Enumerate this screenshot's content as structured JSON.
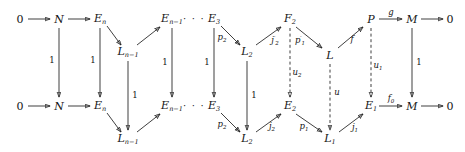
{
  "diagram": {
    "nodes": [
      {
        "id": "n_zero_tl",
        "text": "0",
        "x": 20,
        "y": 19,
        "italic": false
      },
      {
        "id": "n_N_t",
        "text": "N",
        "x": 59,
        "y": 19,
        "italic": true
      },
      {
        "id": "n_En_t",
        "text": "E",
        "sub": "n",
        "x": 100,
        "y": 19,
        "italic": true
      },
      {
        "id": "n_Lnm1_t",
        "text": "L",
        "sub": "n−1",
        "x": 128,
        "y": 52,
        "italic": true
      },
      {
        "id": "n_Enm1_t",
        "text": "E",
        "sub": "n−1",
        "x": 172,
        "y": 19,
        "italic": true
      },
      {
        "id": "n_E3_t",
        "text": "E",
        "sub": "3",
        "x": 214,
        "y": 19,
        "italic": true
      },
      {
        "id": "n_L2_t",
        "text": "L",
        "sub": "2",
        "x": 247,
        "y": 52,
        "italic": true
      },
      {
        "id": "n_F2_t",
        "text": "F",
        "sub": "2",
        "x": 290,
        "y": 19,
        "italic": true
      },
      {
        "id": "n_L_t",
        "text": "L",
        "x": 330,
        "y": 55,
        "italic": true
      },
      {
        "id": "n_P_t",
        "text": "P",
        "x": 371,
        "y": 19,
        "italic": true
      },
      {
        "id": "n_M_t",
        "text": "M",
        "x": 412,
        "y": 19,
        "italic": true
      },
      {
        "id": "n_zero_tr",
        "text": "0",
        "x": 450,
        "y": 19,
        "italic": false
      },
      {
        "id": "n_zero_bl",
        "text": "0",
        "x": 20,
        "y": 106,
        "italic": false
      },
      {
        "id": "n_N_b",
        "text": "N",
        "x": 59,
        "y": 106,
        "italic": true
      },
      {
        "id": "n_En_b",
        "text": "E",
        "sub": "n",
        "x": 100,
        "y": 106,
        "italic": true
      },
      {
        "id": "n_Lnm1_b",
        "text": "L",
        "sub": "n−1",
        "x": 128,
        "y": 139,
        "italic": true
      },
      {
        "id": "n_Enm1_b",
        "text": "E",
        "sub": "n−1",
        "x": 172,
        "y": 106,
        "italic": true
      },
      {
        "id": "n_E3_b",
        "text": "E",
        "sub": "3",
        "x": 214,
        "y": 106,
        "italic": true
      },
      {
        "id": "n_L2_b",
        "text": "L",
        "sub": "2",
        "x": 247,
        "y": 139,
        "italic": true
      },
      {
        "id": "n_E2_b",
        "text": "E",
        "sub": "2",
        "x": 290,
        "y": 106,
        "italic": true
      },
      {
        "id": "n_L1_b",
        "text": "L",
        "sub": "1",
        "x": 330,
        "y": 139,
        "italic": true
      },
      {
        "id": "n_E1_b",
        "text": "E",
        "sub": "1",
        "x": 371,
        "y": 106,
        "italic": true
      },
      {
        "id": "n_M_b",
        "text": "M",
        "x": 412,
        "y": 106,
        "italic": true
      },
      {
        "id": "n_zero_br",
        "text": "0",
        "x": 450,
        "y": 106,
        "italic": false
      }
    ],
    "ellipses": [
      {
        "id": "dots_top",
        "text": "· · ·",
        "x": 194,
        "y": 18
      },
      {
        "id": "dots_bottom",
        "text": "· · ·",
        "x": 194,
        "y": 105
      }
    ],
    "labels": [
      {
        "id": "lbl_id_N",
        "text": "1",
        "x": 52,
        "y": 60,
        "italic": false
      },
      {
        "id": "lbl_id_En",
        "text": "1",
        "x": 93,
        "y": 60,
        "italic": false
      },
      {
        "id": "lbl_id_Lnm1",
        "text": "1",
        "x": 135,
        "y": 95,
        "italic": false
      },
      {
        "id": "lbl_id_Enm1",
        "text": "1",
        "x": 165,
        "y": 62,
        "italic": false
      },
      {
        "id": "lbl_id_E3",
        "text": "1",
        "x": 207,
        "y": 62,
        "italic": false
      },
      {
        "id": "lbl_p2_top",
        "text": "p",
        "sub": "2",
        "x": 222,
        "y": 38,
        "italic": true
      },
      {
        "id": "lbl_id_L2",
        "text": "1",
        "x": 254,
        "y": 95,
        "italic": false
      },
      {
        "id": "lbl_j2p",
        "text": "j",
        "sup": "′",
        "sub": "2",
        "x": 275,
        "y": 41,
        "italic": true
      },
      {
        "id": "lbl_p1p",
        "text": "p",
        "sup": "′",
        "sub": "1",
        "x": 300,
        "y": 41,
        "italic": true
      },
      {
        "id": "lbl_u2",
        "text": "u",
        "sub": "2",
        "x": 297,
        "y": 73,
        "italic": true
      },
      {
        "id": "lbl_f",
        "text": "f",
        "x": 352,
        "y": 39,
        "italic": true
      },
      {
        "id": "lbl_u",
        "text": "u",
        "x": 337,
        "y": 92,
        "italic": true
      },
      {
        "id": "lbl_g",
        "text": "g",
        "x": 391,
        "y": 12,
        "italic": true
      },
      {
        "id": "lbl_u1",
        "text": "u",
        "sub": "1",
        "x": 378,
        "y": 66,
        "italic": true
      },
      {
        "id": "lbl_id_M",
        "text": "1",
        "x": 419,
        "y": 62,
        "italic": false
      },
      {
        "id": "lbl_p2_bot",
        "text": "p",
        "sub": "2",
        "x": 222,
        "y": 125,
        "italic": true
      },
      {
        "id": "lbl_j2",
        "text": "j",
        "sub": "2",
        "x": 272,
        "y": 127,
        "italic": true
      },
      {
        "id": "lbl_p1_bot",
        "text": "p",
        "sub": "1",
        "x": 304,
        "y": 127,
        "italic": true
      },
      {
        "id": "lbl_j1",
        "text": "j",
        "sub": "1",
        "x": 355,
        "y": 128,
        "italic": true
      },
      {
        "id": "lbl_f0",
        "text": "f",
        "sub": "0",
        "x": 391,
        "y": 99,
        "italic": true
      }
    ],
    "arrows": [
      {
        "id": "a_zero_N_t",
        "x1": 28,
        "y1": 19,
        "x2": 50,
        "y2": 19,
        "dashed": false
      },
      {
        "id": "a_N_En_t",
        "x1": 68,
        "y1": 19,
        "x2": 90,
        "y2": 19,
        "dashed": false
      },
      {
        "id": "a_En_Lnm1_t",
        "x1": 107,
        "y1": 26,
        "x2": 121,
        "y2": 45,
        "dashed": false
      },
      {
        "id": "a_Lnm1_Enm1_t",
        "x1": 137,
        "y1": 45,
        "x2": 160,
        "y2": 27,
        "dashed": false
      },
      {
        "id": "a_E3_L2_t",
        "x1": 221,
        "y1": 26,
        "x2": 240,
        "y2": 45,
        "dashed": false
      },
      {
        "id": "a_L2_F2_t",
        "x1": 256,
        "y1": 45,
        "x2": 281,
        "y2": 27,
        "dashed": false
      },
      {
        "id": "a_F2_L_t",
        "x1": 296,
        "y1": 27,
        "x2": 322,
        "y2": 48,
        "dashed": false
      },
      {
        "id": "a_L_P_t",
        "x1": 338,
        "y1": 48,
        "x2": 363,
        "y2": 27,
        "dashed": false
      },
      {
        "id": "a_P_M_t",
        "x1": 379,
        "y1": 19,
        "x2": 402,
        "y2": 19,
        "dashed": false
      },
      {
        "id": "a_M_zero_t",
        "x1": 421,
        "y1": 19,
        "x2": 443,
        "y2": 19,
        "dashed": false
      },
      {
        "id": "a_zero_N_b",
        "x1": 28,
        "y1": 106,
        "x2": 50,
        "y2": 106,
        "dashed": false
      },
      {
        "id": "a_N_En_b",
        "x1": 68,
        "y1": 106,
        "x2": 90,
        "y2": 106,
        "dashed": false
      },
      {
        "id": "a_En_Lnm1_b",
        "x1": 107,
        "y1": 113,
        "x2": 121,
        "y2": 132,
        "dashed": false
      },
      {
        "id": "a_Lnm1_Enm1_b",
        "x1": 137,
        "y1": 132,
        "x2": 160,
        "y2": 114,
        "dashed": false
      },
      {
        "id": "a_E3_L2_b",
        "x1": 221,
        "y1": 113,
        "x2": 240,
        "y2": 132,
        "dashed": false
      },
      {
        "id": "a_L2_E2_b",
        "x1": 256,
        "y1": 132,
        "x2": 281,
        "y2": 114,
        "dashed": false
      },
      {
        "id": "a_E2_L1_b",
        "x1": 296,
        "y1": 114,
        "x2": 322,
        "y2": 132,
        "dashed": false
      },
      {
        "id": "a_L1_E1_b",
        "x1": 339,
        "y1": 132,
        "x2": 363,
        "y2": 114,
        "dashed": false
      },
      {
        "id": "a_E1_M_b",
        "x1": 379,
        "y1": 106,
        "x2": 402,
        "y2": 106,
        "dashed": false
      },
      {
        "id": "a_M_zero_b",
        "x1": 421,
        "y1": 106,
        "x2": 443,
        "y2": 106,
        "dashed": false
      },
      {
        "id": "a_v_N",
        "x1": 59,
        "y1": 28,
        "x2": 59,
        "y2": 97,
        "dashed": false
      },
      {
        "id": "a_v_En",
        "x1": 100,
        "y1": 28,
        "x2": 100,
        "y2": 97,
        "dashed": false
      },
      {
        "id": "a_v_Lnm1",
        "x1": 128,
        "y1": 61,
        "x2": 128,
        "y2": 130,
        "dashed": false
      },
      {
        "id": "a_v_Enm1",
        "x1": 172,
        "y1": 28,
        "x2": 172,
        "y2": 97,
        "dashed": false
      },
      {
        "id": "a_v_E3",
        "x1": 214,
        "y1": 28,
        "x2": 214,
        "y2": 97,
        "dashed": false
      },
      {
        "id": "a_v_L2",
        "x1": 247,
        "y1": 61,
        "x2": 247,
        "y2": 130,
        "dashed": false
      },
      {
        "id": "a_v_F2_E2",
        "x1": 290,
        "y1": 28,
        "x2": 290,
        "y2": 97,
        "dashed": true
      },
      {
        "id": "a_v_L_L1",
        "x1": 330,
        "y1": 64,
        "x2": 330,
        "y2": 130,
        "dashed": true
      },
      {
        "id": "a_v_P_E1",
        "x1": 371,
        "y1": 28,
        "x2": 371,
        "y2": 97,
        "dashed": true
      },
      {
        "id": "a_v_M",
        "x1": 412,
        "y1": 28,
        "x2": 412,
        "y2": 97,
        "dashed": false
      }
    ]
  }
}
